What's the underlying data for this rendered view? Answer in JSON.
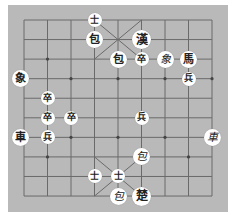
{
  "game": "Janggi",
  "board": {
    "columns": 9,
    "rows": 10,
    "background": "#b9b9b9",
    "line_color": "#6a6a6a",
    "origin": [
      24,
      20
    ],
    "cell_w": 23.5,
    "cell_h": 19.56,
    "dots": [
      [
        1,
        2
      ],
      [
        7,
        2
      ],
      [
        0,
        3
      ],
      [
        2,
        3
      ],
      [
        4,
        3
      ],
      [
        6,
        3
      ],
      [
        8,
        3
      ],
      [
        0,
        6
      ],
      [
        2,
        6
      ],
      [
        4,
        6
      ],
      [
        6,
        6
      ],
      [
        8,
        6
      ],
      [
        1,
        7
      ],
      [
        7,
        7
      ]
    ]
  },
  "pieces": [
    {
      "glyph": "士",
      "col": 3,
      "row": 0,
      "size": "small",
      "side": "han"
    },
    {
      "glyph": "包",
      "col": 3,
      "row": 1,
      "size": "normal",
      "side": "han"
    },
    {
      "glyph": "漢",
      "col": 5,
      "row": 1,
      "size": "big",
      "side": "han"
    },
    {
      "glyph": "包",
      "col": 4,
      "row": 2,
      "size": "normal",
      "side": "han"
    },
    {
      "glyph": "卒",
      "col": 5,
      "row": 2,
      "size": "small",
      "side": "han"
    },
    {
      "glyph": "象",
      "col": 6,
      "row": 2,
      "size": "normal",
      "side": "cho",
      "cursive": true
    },
    {
      "glyph": "馬",
      "col": 7,
      "row": 2,
      "size": "normal",
      "side": "han"
    },
    {
      "glyph": "兵",
      "col": 7,
      "row": 3,
      "size": "small",
      "side": "cho"
    },
    {
      "glyph": "象",
      "col": 0,
      "row": 3,
      "size": "normal",
      "side": "han",
      "dx": -4
    },
    {
      "glyph": "卒",
      "col": 1,
      "row": 4,
      "size": "small",
      "side": "han"
    },
    {
      "glyph": "卒",
      "col": 1,
      "row": 5,
      "size": "small",
      "side": "han"
    },
    {
      "glyph": "卒",
      "col": 2,
      "row": 5,
      "size": "small",
      "side": "han"
    },
    {
      "glyph": "兵",
      "col": 5,
      "row": 5,
      "size": "small",
      "side": "cho"
    },
    {
      "glyph": "車",
      "col": 0,
      "row": 6,
      "size": "normal",
      "side": "han",
      "dx": -4
    },
    {
      "glyph": "兵",
      "col": 1,
      "row": 6,
      "size": "small",
      "side": "cho"
    },
    {
      "glyph": "車",
      "col": 8,
      "row": 6,
      "size": "normal",
      "side": "cho",
      "cursive": true
    },
    {
      "glyph": "包",
      "col": 5,
      "row": 7,
      "size": "normal",
      "side": "cho",
      "cursive": true
    },
    {
      "glyph": "士",
      "col": 3,
      "row": 8,
      "size": "small",
      "side": "cho"
    },
    {
      "glyph": "士",
      "col": 4,
      "row": 8,
      "size": "small",
      "side": "cho"
    },
    {
      "glyph": "包",
      "col": 4,
      "row": 9,
      "size": "normal",
      "side": "cho",
      "cursive": true
    },
    {
      "glyph": "楚",
      "col": 5,
      "row": 9,
      "size": "big",
      "side": "cho"
    }
  ]
}
